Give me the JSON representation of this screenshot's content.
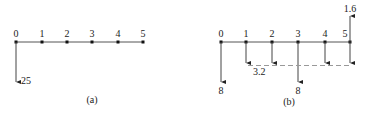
{
  "panel_a": {
    "caption": "(a)",
    "nodes": [
      "0",
      "1",
      "2",
      "3",
      "4",
      "5"
    ],
    "load": {
      "node": "0",
      "value": "25",
      "direction": "down"
    }
  },
  "panel_b": {
    "caption": "(b)",
    "nodes": [
      "0",
      "1",
      "2",
      "3",
      "4",
      "5"
    ],
    "loads": [
      {
        "node": "0",
        "value": "8",
        "direction": "down"
      },
      {
        "node": "3",
        "value": "8",
        "direction": "down"
      },
      {
        "node": "5",
        "value": "1.6",
        "direction": "up"
      }
    ],
    "distributed": {
      "value": "3.2",
      "nodes": [
        "1",
        "2",
        "3",
        "4",
        "5"
      ],
      "direction": "down"
    }
  },
  "colors": {
    "line": "#444444",
    "dashed": "#999999",
    "node": "#111111"
  }
}
